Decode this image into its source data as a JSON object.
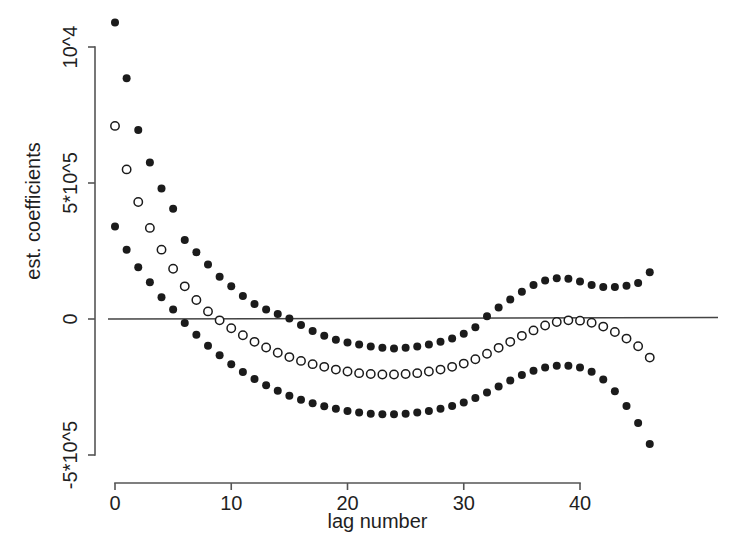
{
  "figure": {
    "width": 744,
    "height": 551,
    "background": "#ffffff"
  },
  "axes": {
    "x_title": "lag number",
    "y_title": "est. coefficients",
    "x_tick_labels": [
      "0",
      "10",
      "20",
      "30",
      "40"
    ],
    "y_tick_labels": [
      "10^4",
      "5*10^5",
      "0",
      "-5*10^5"
    ]
  },
  "chart_data": {
    "type": "scatter",
    "title": "",
    "xlabel": "lag number",
    "ylabel": "est. coefficients",
    "xlim": [
      -1.5,
      47
    ],
    "ylim": [
      -5e-05,
      0.0001
    ],
    "xticks": [
      0,
      10,
      20,
      30,
      40
    ],
    "xticklabels": [
      "0",
      "10",
      "20",
      "30",
      "40"
    ],
    "yticks": [
      0.0001,
      5e-05,
      0,
      -5e-05
    ],
    "yticklabels": [
      "10^4",
      "5*10^5",
      "0",
      "-5*10^5"
    ],
    "grid": false,
    "legend": "none",
    "annotations": [
      {
        "type": "hline",
        "y": 0,
        "label": "zero reference line",
        "color": "#444444"
      }
    ],
    "x": [
      0,
      1,
      2,
      3,
      4,
      5,
      6,
      7,
      8,
      9,
      10,
      11,
      12,
      13,
      14,
      15,
      16,
      17,
      18,
      19,
      20,
      21,
      22,
      23,
      24,
      25,
      26,
      27,
      28,
      29,
      30,
      31,
      32,
      33,
      34,
      35,
      36,
      37,
      38,
      39,
      40,
      41,
      42,
      43,
      44,
      45,
      46
    ],
    "series": [
      {
        "name": "upper confidence band",
        "marker": "filled-circle",
        "color": "#1b1b1b",
        "values": [
          0.000109,
          8.85e-05,
          6.95e-05,
          5.75e-05,
          4.8e-05,
          4.05e-05,
          2.9e-05,
          2.45e-05,
          2e-05,
          1.55e-05,
          1.2e-05,
          8.5e-06,
          5.5e-06,
          3.5e-06,
          1.8e-06,
          2e-07,
          -2.2e-06,
          -4.4e-06,
          -6.2e-06,
          -7.6e-06,
          -8.6e-06,
          -9.4e-06,
          -1.01e-05,
          -1.06e-05,
          -1.08e-05,
          -1.06e-05,
          -1.01e-05,
          -9.4e-06,
          -8.4e-06,
          -7.2e-06,
          -5.4e-06,
          -3e-06,
          1e-06,
          4.2e-06,
          7.2e-06,
          1e-05,
          1.25e-05,
          1.42e-05,
          1.5e-05,
          1.48e-05,
          1.38e-05,
          1.25e-05,
          1.18e-05,
          1.18e-05,
          1.22e-05,
          1.32e-05,
          1.72e-05
        ]
      },
      {
        "name": "estimated coefficients",
        "marker": "open-circle",
        "color": "#1b1b1b",
        "values": [
          7.1e-05,
          5.5e-05,
          4.3e-05,
          3.35e-05,
          2.55e-05,
          1.85e-05,
          1.2e-05,
          7e-06,
          2.8e-06,
          -5e-07,
          -3.4e-06,
          -6e-06,
          -8.4e-06,
          -1.05e-05,
          -1.24e-05,
          -1.4e-05,
          -1.54e-05,
          -1.66e-05,
          -1.76e-05,
          -1.86e-05,
          -1.93e-05,
          -1.99e-05,
          -2.02e-05,
          -2.04e-05,
          -2.04e-05,
          -2.02e-05,
          -1.99e-05,
          -1.93e-05,
          -1.86e-05,
          -1.76e-05,
          -1.64e-05,
          -1.48e-05,
          -1.28e-05,
          -1.06e-05,
          -8.4e-06,
          -6.2e-06,
          -4.2e-06,
          -2.4e-06,
          -1.1e-06,
          -5e-07,
          -6e-07,
          -1.4e-06,
          -2.8e-06,
          -4.8e-06,
          -7.2e-06,
          -1e-05,
          -1.42e-05
        ]
      },
      {
        "name": "lower confidence band",
        "marker": "filled-circle",
        "color": "#1b1b1b",
        "values": [
          3.4e-05,
          2.55e-05,
          1.9e-05,
          1.35e-05,
          8e-06,
          3.5e-06,
          -1.5e-06,
          -5.8e-06,
          -9.8e-06,
          -1.33e-05,
          -1.66e-05,
          -1.95e-05,
          -2.21e-05,
          -2.44e-05,
          -2.64e-05,
          -2.82e-05,
          -2.97e-05,
          -3.1e-05,
          -3.21e-05,
          -3.3e-05,
          -3.38e-05,
          -3.44e-05,
          -3.48e-05,
          -3.5e-05,
          -3.5e-05,
          -3.48e-05,
          -3.44e-05,
          -3.38e-05,
          -3.3e-05,
          -3.2e-05,
          -3.07e-05,
          -2.9e-05,
          -2.7e-05,
          -2.48e-05,
          -2.26e-05,
          -2.06e-05,
          -1.9e-05,
          -1.78e-05,
          -1.72e-05,
          -1.72e-05,
          -1.78e-05,
          -1.94e-05,
          -2.22e-05,
          -2.66e-05,
          -3.2e-05,
          -3.82e-05,
          -4.6e-05
        ]
      }
    ]
  }
}
